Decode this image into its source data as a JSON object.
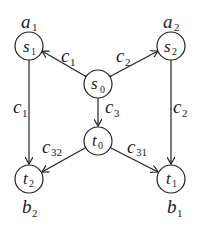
{
  "diagram": {
    "nodes": [
      {
        "id": "s1",
        "label": "s",
        "sub": "1",
        "x": 29,
        "y": 46,
        "weight": "a",
        "weight_sub": "1",
        "weight_pos": "above"
      },
      {
        "id": "s2",
        "label": "s",
        "sub": "2",
        "x": 171,
        "y": 46,
        "weight": "a",
        "weight_sub": "2",
        "weight_pos": "above"
      },
      {
        "id": "s0",
        "label": "s",
        "sub": "0",
        "x": 98,
        "y": 84
      },
      {
        "id": "t0",
        "label": "t",
        "sub": "0",
        "x": 98,
        "y": 141
      },
      {
        "id": "t2",
        "label": "t",
        "sub": "2",
        "x": 29,
        "y": 179,
        "weight": "b",
        "weight_sub": "2",
        "weight_pos": "below"
      },
      {
        "id": "t1",
        "label": "t",
        "sub": "1",
        "x": 171,
        "y": 179,
        "weight": "b",
        "weight_sub": "1",
        "weight_pos": "below"
      }
    ],
    "edges": [
      {
        "from": "s0",
        "to": "s1",
        "label": "c",
        "sub": "1",
        "bidirectional": true
      },
      {
        "from": "s0",
        "to": "s2",
        "label": "c",
        "sub": "2",
        "bidirectional": true
      },
      {
        "from": "s0",
        "to": "t0",
        "label": "c",
        "sub": "3"
      },
      {
        "from": "s1",
        "to": "t2",
        "label": "c",
        "sub": "1"
      },
      {
        "from": "s2",
        "to": "t1",
        "label": "c",
        "sub": "2"
      },
      {
        "from": "t0",
        "to": "t2",
        "label": "c",
        "sub": "32"
      },
      {
        "from": "t0",
        "to": "t1",
        "label": "c",
        "sub": "31"
      }
    ]
  }
}
